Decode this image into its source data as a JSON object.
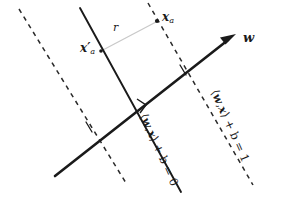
{
  "figure": {
    "background_color": "#ffffff",
    "width": 284,
    "height": 199
  },
  "labels": {
    "point_xa": {
      "text": "x",
      "subscript": "a",
      "prime": "",
      "description": "data point x_a on the margin boundary"
    },
    "point_xa_prime": {
      "text": "x",
      "subscript": "a",
      "prime": "′",
      "description": "projection of x_a onto the decision hyperplane"
    },
    "distance_r": {
      "text": "r",
      "description": "geometric margin distance between x_a and its projection"
    },
    "weight_vector": {
      "text": "w",
      "description": "normal weight vector of the hyperplane"
    },
    "hyperplane_zero": {
      "bracket_open": "⟨",
      "var1": "w",
      "comma": ",",
      "var2": "x",
      "bracket_close": "⟩",
      "rest": " + b = 0",
      "full": "⟨w, x⟩ + b = 0"
    },
    "hyperplane_one": {
      "bracket_open": "⟨",
      "var1": "w",
      "comma": ",",
      "var2": "x",
      "bracket_close": "⟩",
      "rest": " + b = 1",
      "full": "⟨w, x⟩ + b = 1"
    }
  },
  "colors": {
    "line": "#1a1a1a",
    "dashed": "#2a2a2a",
    "connector": "#c9c9c9",
    "text": "#1a1a1a",
    "background": "#ffffff"
  },
  "geometry": {
    "hyperplane_solid": {
      "x1": 80,
      "y1": 8,
      "x2": 181,
      "y2": 192
    },
    "weight_arrow": {
      "x1": 55,
      "y1": 176,
      "x2": 234,
      "y2": 36
    },
    "dashed_left": {
      "x1": 19,
      "y1": 9,
      "x2": 126,
      "y2": 183
    },
    "dashed_right": {
      "x1": 148,
      "y1": 3,
      "x2": 253,
      "y2": 185
    },
    "connector_r": {
      "x1": 101,
      "y1": 51,
      "x2": 156,
      "y2": 22
    },
    "point_marker": {
      "cx": 157,
      "cy": 21,
      "r": 2.1
    },
    "right_angle_marker": {
      "x": 142,
      "y": 104
    }
  }
}
